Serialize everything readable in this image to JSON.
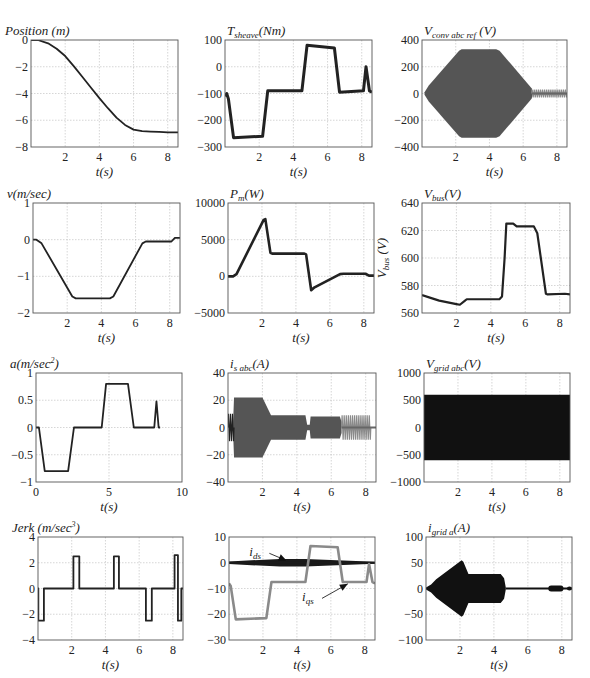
{
  "figure": {
    "background": "#ffffff",
    "line_color": "#222222",
    "gray_color": "#8a8a8a",
    "fill_dark": "#2a2a2a",
    "fill_gray": "#555555"
  },
  "chart_data": [
    {
      "id": "position",
      "type": "line",
      "title": "Position (m)",
      "title_main": "Position (m)",
      "title_sub": "",
      "title_tail": "",
      "xlabel": "t(s)",
      "ylabel": "",
      "box": [
        31,
        40,
        178,
        147
      ],
      "xlim": [
        0,
        8.6
      ],
      "ylim": [
        -8,
        0
      ],
      "xticks": [
        2,
        4,
        6,
        8
      ],
      "yticks": [
        0,
        -2,
        -4,
        -6,
        -8
      ],
      "ytick_labels": [
        "0",
        "−2",
        "−4",
        "−6",
        "−8"
      ],
      "series": [
        {
          "name": "position",
          "color": "#222",
          "width": 1.8,
          "x": [
            0,
            0.4,
            1,
            1.5,
            2,
            2.5,
            3,
            3.5,
            4,
            4.5,
            5,
            5.5,
            6,
            6.5,
            7,
            7.5,
            8,
            8.6
          ],
          "y": [
            0,
            0,
            -0.25,
            -0.65,
            -1.2,
            -1.95,
            -2.75,
            -3.55,
            -4.35,
            -5.1,
            -5.8,
            -6.35,
            -6.7,
            -6.82,
            -6.85,
            -6.87,
            -6.9,
            -6.9
          ]
        }
      ]
    },
    {
      "id": "t_sheave",
      "type": "line",
      "title": "T_sheave(Nm)",
      "title_main": "T",
      "title_sub": "sheave",
      "title_tail": "(Nm)",
      "xlabel": "t(s)",
      "ylabel": "",
      "box": [
        225,
        40,
        372,
        147
      ],
      "xlim": [
        0,
        8.6
      ],
      "ylim": [
        -300,
        100
      ],
      "xticks": [
        2,
        4,
        6,
        8
      ],
      "yticks": [
        100,
        0,
        -100,
        -200,
        -300
      ],
      "ytick_labels": [
        "100",
        "0",
        "−100",
        "−200",
        "−300"
      ],
      "series": [
        {
          "name": "torque",
          "color": "#222",
          "width": 3,
          "x": [
            0,
            0.1,
            0.2,
            0.5,
            2.2,
            2.5,
            4.5,
            4.8,
            6.4,
            6.7,
            8.1,
            8.25,
            8.45,
            8.6
          ],
          "y": [
            -110,
            -100,
            -120,
            -265,
            -260,
            -90,
            -90,
            80,
            70,
            -95,
            -90,
            0,
            -90,
            -95
          ]
        }
      ]
    },
    {
      "id": "v_conv_abc_ref",
      "type": "area",
      "title": "V_conv abc ref (V)",
      "title_main": "V",
      "title_sub": "conv abc ref",
      "title_tail": " (V)",
      "xlabel": "t(s)",
      "ylabel": "",
      "box": [
        422,
        40,
        567,
        147
      ],
      "xlim": [
        0,
        8.6
      ],
      "ylim": [
        -400,
        400
      ],
      "xticks": [
        2,
        4,
        6,
        8
      ],
      "yticks": [
        400,
        200,
        0,
        -200,
        -400
      ],
      "ytick_labels": [
        "400",
        "200",
        "0",
        "−200",
        "−400"
      ],
      "envelope": {
        "color": "#555",
        "x": [
          0.15,
          0.4,
          2.2,
          2.35,
          4.4,
          4.6,
          6.5,
          6.55
        ],
        "upper": [
          10,
          60,
          320,
          330,
          330,
          320,
          40,
          15
        ],
        "lower": [
          -10,
          -60,
          -320,
          -330,
          -330,
          -320,
          -40,
          -15
        ]
      },
      "tail": {
        "color": "#8a8a8a",
        "x0": 6.5,
        "x1": 8.6,
        "amp": 30
      }
    },
    {
      "id": "velocity",
      "type": "line",
      "title": "v(m/sec)",
      "title_main": "v(m/sec)",
      "title_sub": "",
      "title_tail": "",
      "xlabel": "t(s)",
      "ylabel": "",
      "box": [
        33,
        203,
        180,
        313
      ],
      "xlim": [
        0,
        8.6
      ],
      "ylim": [
        -2,
        1
      ],
      "xticks": [
        2,
        4,
        6,
        8
      ],
      "yticks": [
        1,
        0,
        -1,
        -2
      ],
      "ytick_labels": [
        "1",
        "0",
        "−1",
        "−2"
      ],
      "series": [
        {
          "name": "v",
          "color": "#222",
          "width": 1.8,
          "x": [
            0,
            0.2,
            0.5,
            2.3,
            2.5,
            4.5,
            4.7,
            6.4,
            6.6,
            8.1,
            8.3,
            8.6
          ],
          "y": [
            0,
            0,
            -0.1,
            -1.55,
            -1.6,
            -1.6,
            -1.55,
            -0.1,
            -0.05,
            -0.05,
            0.05,
            0.05
          ]
        }
      ]
    },
    {
      "id": "p_m",
      "type": "line",
      "title": "P_m(W)",
      "title_main": "P",
      "title_sub": "m",
      "title_tail": "(W)",
      "xlabel": "t(s)",
      "ylabel": "",
      "box": [
        228,
        203,
        374,
        313
      ],
      "xlim": [
        0,
        8.6
      ],
      "ylim": [
        -5000,
        10000
      ],
      "xticks": [
        2,
        4,
        6,
        8
      ],
      "yticks": [
        10000,
        5000,
        0,
        -5000
      ],
      "ytick_labels": [
        "10000",
        "5000",
        "0",
        "−5000"
      ],
      "series": [
        {
          "name": "Pm",
          "color": "#222",
          "width": 2.6,
          "x": [
            0,
            0.3,
            0.5,
            2.1,
            2.2,
            2.5,
            2.6,
            4.5,
            4.6,
            4.9,
            5.1,
            6.6,
            6.8,
            8.1,
            8.3,
            8.6
          ],
          "y": [
            0,
            0,
            300,
            7700,
            7800,
            3200,
            3100,
            3100,
            3000,
            -1900,
            -1500,
            300,
            350,
            350,
            100,
            100
          ]
        }
      ]
    },
    {
      "id": "v_bus",
      "type": "line",
      "title": "V_bus(V)",
      "title_main": "V",
      "title_sub": "bus",
      "title_tail": "(V)",
      "xlabel": "t(s)",
      "ylabel": "V_bus (V)",
      "box": [
        422,
        203,
        570,
        313
      ],
      "xlim": [
        0,
        8.6
      ],
      "ylim": [
        560,
        640
      ],
      "xticks": [
        2,
        4,
        6,
        8
      ],
      "yticks": [
        640,
        620,
        600,
        580,
        560
      ],
      "ytick_labels": [
        "640",
        "620",
        "600",
        "580",
        "560"
      ],
      "series": [
        {
          "name": "Vbus",
          "color": "#222",
          "width": 2.2,
          "x": [
            0,
            0.5,
            1,
            2,
            2.2,
            2.5,
            2.6,
            4.5,
            4.65,
            4.8,
            4.9,
            5.3,
            5.5,
            6.5,
            6.7,
            7.2,
            7.3,
            8.3,
            8.6
          ],
          "y": [
            573,
            571,
            569,
            566.5,
            566,
            569,
            570,
            570,
            572,
            600,
            625,
            625,
            623,
            623,
            618,
            574,
            573.5,
            574,
            573.5
          ]
        }
      ]
    },
    {
      "id": "acceleration",
      "type": "line",
      "title": "a(m/sec^2)",
      "title_main": "a(m/sec",
      "title_sub": "",
      "title_sup": "2",
      "title_tail": ")",
      "xlabel": "t(s)",
      "ylabel": "",
      "box": [
        36,
        373,
        182,
        482
      ],
      "xlim": [
        0,
        10
      ],
      "ylim": [
        -1,
        1
      ],
      "xticks": [
        0,
        5,
        10
      ],
      "yticks": [
        1,
        0.5,
        0,
        -0.5,
        -1
      ],
      "ytick_labels": [
        "1",
        "0.5",
        "0",
        "−0.5",
        "−1"
      ],
      "xtick_labels": [
        "0",
        "5",
        "10"
      ],
      "series": [
        {
          "name": "a",
          "color": "#222",
          "width": 1.8,
          "x": [
            0,
            0.2,
            0.6,
            2.2,
            2.6,
            4.5,
            4.8,
            6.3,
            6.7,
            8.1,
            8.25,
            8.4,
            8.5
          ],
          "y": [
            0,
            0,
            -0.8,
            -0.8,
            0,
            0,
            0.8,
            0.8,
            0,
            0,
            0.48,
            0,
            0
          ]
        }
      ]
    },
    {
      "id": "i_s_abc",
      "type": "area",
      "title": "i_s abc(A)",
      "title_main": "i",
      "title_sub": "s abc",
      "title_tail": "(A)",
      "xlabel": "t(s)",
      "ylabel": "",
      "box": [
        228,
        373,
        376,
        482
      ],
      "xlim": [
        0,
        8.6
      ],
      "ylim": [
        -40,
        40
      ],
      "xticks": [
        2,
        4,
        6,
        8
      ],
      "yticks": [
        40,
        20,
        0,
        -20,
        -40
      ],
      "ytick_labels": [
        "40",
        "20",
        "0",
        "−20",
        "−40"
      ],
      "envelope": {
        "color": "#555",
        "x": [
          0.3,
          0.35,
          2.0,
          2.5,
          4.5,
          4.6,
          4.75,
          4.8,
          6.5,
          6.6
        ],
        "upper": [
          5,
          22,
          22,
          9,
          9,
          2,
          2,
          8,
          8,
          4
        ],
        "lower": [
          -5,
          -22,
          -22,
          -9,
          -9,
          -2,
          -2,
          -8,
          -8,
          -4
        ]
      },
      "tail": {
        "color": "#8a8a8a",
        "x0": 6.6,
        "x1": 8.3,
        "amp": 9
      },
      "start": {
        "color": "#222",
        "x0": 0,
        "x1": 0.35,
        "amp": 10
      }
    },
    {
      "id": "v_grid_abc",
      "type": "area",
      "title": "V_grid abc(V)",
      "title_main": "V",
      "title_sub": "grid abc",
      "title_tail": "(V)",
      "xlabel": "t(s)",
      "ylabel": "",
      "box": [
        424,
        373,
        570,
        482
      ],
      "xlim": [
        0,
        8.6
      ],
      "ylim": [
        -1000,
        1000
      ],
      "xticks": [
        2,
        4,
        6,
        8
      ],
      "yticks": [
        1000,
        500,
        0,
        -500,
        -1000
      ],
      "ytick_labels": [
        "1000",
        "500",
        "0",
        "−500",
        "−1000"
      ],
      "envelope": {
        "color": "#111",
        "x": [
          0,
          8.6
        ],
        "upper": [
          600,
          600
        ],
        "lower": [
          -600,
          -600
        ]
      }
    },
    {
      "id": "jerk",
      "type": "line",
      "title": "Jerk (m/sec^3)",
      "title_main": "Jerk (m/sec",
      "title_sub": "",
      "title_sup": "3",
      "title_tail": ")",
      "xlabel": "t(s)",
      "ylabel": "",
      "box": [
        38,
        537,
        183,
        640
      ],
      "xlim": [
        0,
        8.6
      ],
      "ylim": [
        -4,
        4
      ],
      "xticks": [
        2,
        4,
        6,
        8
      ],
      "yticks": [
        4,
        2,
        0,
        -2,
        -4
      ],
      "ytick_labels": [
        "4",
        "2",
        "0",
        "−2",
        "−4"
      ],
      "series": [
        {
          "name": "jerk",
          "color": "#222",
          "width": 1.8,
          "x": [
            0,
            0.02,
            0.02,
            0.35,
            0.35,
            2.1,
            2.1,
            2.45,
            2.45,
            4.5,
            4.5,
            4.8,
            4.8,
            6.4,
            6.4,
            6.75,
            6.75,
            8.1,
            8.1,
            8.3,
            8.3,
            8.5,
            8.5,
            8.6
          ],
          "y": [
            0,
            0,
            -2.5,
            -2.5,
            0,
            0,
            2.5,
            2.5,
            0,
            0,
            2.5,
            2.5,
            0,
            0,
            -2.5,
            -2.5,
            0,
            0,
            2.6,
            2.6,
            -2.5,
            -2.5,
            0,
            0
          ]
        }
      ]
    },
    {
      "id": "i_dq",
      "type": "line",
      "title": "",
      "title_main": "",
      "title_sub": "",
      "title_tail": "",
      "xlabel": "t(s)",
      "ylabel": "",
      "box": [
        229,
        537,
        375,
        640
      ],
      "xlim": [
        0,
        8.6
      ],
      "ylim": [
        -30,
        10
      ],
      "xticks": [
        2,
        4,
        6,
        8
      ],
      "yticks": [
        10,
        0,
        -10,
        -20,
        -30
      ],
      "ytick_labels": [
        "10",
        "0",
        "−10",
        "−20",
        "−30"
      ],
      "series": [
        {
          "name": "i_ds",
          "label": "i_ds",
          "color": "#1a1a1a",
          "width": 2,
          "x": [
            0,
            8.6
          ],
          "y": [
            0,
            0
          ],
          "band": [
            0.5,
            1.5,
            1.5,
            0.4
          ]
        },
        {
          "name": "i_qs",
          "label": "i_qs",
          "color": "#8a8a8a",
          "width": 2.6,
          "x": [
            0,
            0.1,
            0.4,
            2.2,
            2.5,
            4.5,
            4.8,
            6.4,
            6.7,
            8.1,
            8.25,
            8.45,
            8.6
          ],
          "y": [
            -8,
            -9,
            -22,
            -21.5,
            -7.5,
            -7.5,
            6.5,
            6,
            -7.5,
            -7.5,
            -0.5,
            -7.5,
            -8
          ]
        }
      ],
      "annotations": [
        {
          "text": "i_ds",
          "main": "i",
          "sub": "ds",
          "x": 1.2,
          "y": 2.5,
          "arrow_to": [
            3.4,
            0.8
          ]
        },
        {
          "text": "i_qs",
          "main": "i",
          "sub": "qs",
          "x": 4.3,
          "y": -15,
          "arrow_to": [
            7.0,
            -8.2
          ]
        }
      ]
    },
    {
      "id": "i_grid_a",
      "type": "area",
      "title": "i_grid a(A)",
      "title_main": "i",
      "title_sub": "grid a",
      "title_tail": "(A)",
      "xlabel": "t(s)",
      "ylabel": "",
      "box": [
        426,
        537,
        572,
        640
      ],
      "xlim": [
        0,
        8.6
      ],
      "ylim": [
        -100,
        100
      ],
      "xticks": [
        2,
        4,
        6,
        8
      ],
      "yticks": [
        100,
        50,
        0,
        -50,
        -100
      ],
      "ytick_labels": [
        "100",
        "50",
        "0",
        "−50",
        "−100"
      ],
      "envelope": {
        "color": "#111",
        "x": [
          0,
          0.3,
          0.6,
          2.1,
          2.2,
          2.5,
          4.4,
          4.6,
          4.7
        ],
        "upper": [
          2,
          8,
          18,
          55,
          52,
          28,
          28,
          20,
          2
        ],
        "lower": [
          -2,
          -8,
          -18,
          -55,
          -52,
          -28,
          -28,
          -20,
          -2
        ]
      },
      "trace": {
        "color": "#111",
        "x": [
          4.7,
          8.6
        ],
        "y": [
          0,
          0
        ]
      },
      "blobs": [
        {
          "x0": 7.2,
          "x1": 8.1,
          "amp": 6
        },
        {
          "x0": 8.3,
          "x1": 8.6,
          "amp": 4
        }
      ]
    }
  ]
}
